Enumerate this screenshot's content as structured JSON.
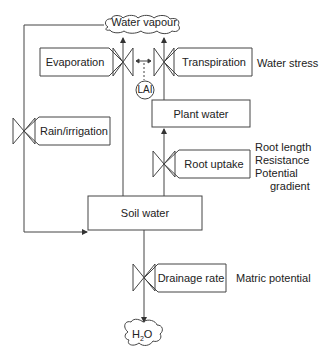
{
  "diagram": {
    "type": "flow-diagram",
    "colors": {
      "line": "#333333",
      "background": "#ffffff"
    },
    "nodes": {
      "water_vapour": {
        "label": "Water vapour",
        "shape": "cloud"
      },
      "plant_water": {
        "label": "Plant water",
        "shape": "box"
      },
      "soil_water": {
        "label": "Soil water",
        "shape": "box"
      },
      "h2o": {
        "label_main": "H",
        "label_sub": "2",
        "label_end": "O",
        "shape": "cloud"
      },
      "lai": {
        "label": "LAI",
        "shape": "circle"
      }
    },
    "valves": {
      "evaporation": {
        "label": "Evaporation"
      },
      "transpiration": {
        "label": "Transpiration"
      },
      "rain_irrigation": {
        "label": "Rain/irrigation"
      },
      "root_uptake": {
        "label": "Root uptake"
      },
      "drainage_rate": {
        "label": "Drainage rate"
      }
    },
    "annotations": {
      "water_stress": "Water stress",
      "root_length": "Root length",
      "resistance": "Resistance",
      "potential": "Potential",
      "gradient": "gradient",
      "matric_potential": "Matric potential"
    }
  }
}
